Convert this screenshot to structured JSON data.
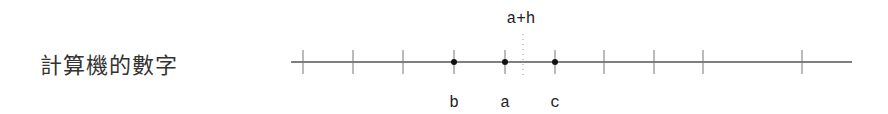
{
  "title": "計算機的數字",
  "diagram": {
    "type": "number-line",
    "line": {
      "x1": 291,
      "x2": 852,
      "y": 62,
      "color": "#555555"
    },
    "ticks_x": [
      303,
      353,
      403,
      454,
      505,
      555,
      604,
      654,
      703,
      802
    ],
    "points": [
      {
        "label": "b",
        "x": 454
      },
      {
        "label": "a",
        "x": 505
      },
      {
        "label": "c",
        "x": 555
      }
    ],
    "marker": {
      "label": "a+h",
      "x": 523,
      "style": "dotted"
    }
  }
}
